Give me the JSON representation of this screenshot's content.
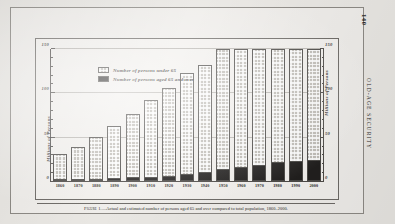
{
  "page": {
    "folio": "140",
    "running_head": "OLD-AGE SECURITY"
  },
  "caption": {
    "figure_label": "Figure 1.",
    "text": "—Actual and estimated number of persons aged 65 and over compared to total population, 1860–2000."
  },
  "legend": [
    {
      "label": "Number of persons under 65",
      "swatch": "stippled-light",
      "color": "#bfbcb6"
    },
    {
      "label": "Number of persons aged 65 and over",
      "swatch": "solid-black",
      "color": "#211f1e"
    }
  ],
  "chart_data": {
    "type": "bar",
    "stacked": true,
    "title": "",
    "xlabel": "",
    "ylabel": "Millions of Persons",
    "ylabel_right": "Millions of Persons",
    "ylim": [
      0,
      150
    ],
    "yticks": [
      0,
      50,
      100,
      150
    ],
    "ytick_labels": [
      "0",
      "50",
      "100",
      "150"
    ],
    "yminor_step": 10,
    "grid": true,
    "legend_position": "upper-left",
    "categories": [
      "1860",
      "1870",
      "1880",
      "1890",
      "1900",
      "1910",
      "1920",
      "1930",
      "1940",
      "1950",
      "1960",
      "1970",
      "1980",
      "1990",
      "2000"
    ],
    "series": [
      {
        "name": "Number of persons aged 65 and over",
        "color": "#211f1e",
        "values": [
          1,
          1.2,
          1.7,
          2.4,
          3.1,
          4,
          4.9,
          6.6,
          9,
          12.3,
          16.6,
          20,
          24.5,
          27,
          28
        ]
      },
      {
        "name": "Number of persons under 65",
        "color": "#bfbcb6",
        "values": [
          30,
          37.4,
          48.4,
          60.5,
          72.9,
          88,
          101.1,
          116.4,
          123,
          138.7,
          148.4,
          158,
          153.5,
          154,
          154
        ]
      }
    ],
    "totals": [
      31,
      38.6,
      50.1,
      62.9,
      76,
      92,
      106,
      123,
      132,
      151,
      165,
      178,
      178,
      181,
      182
    ]
  }
}
